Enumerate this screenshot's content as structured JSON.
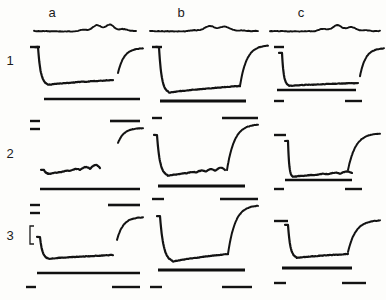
{
  "figure": {
    "kind": "multi-panel-recording-traces",
    "background_color": "#fdfdfb",
    "ink_color": "#131313",
    "width": 386,
    "height": 300,
    "columns": [
      {
        "id": "a",
        "label": "a",
        "label_x": 52,
        "label_y": 17,
        "origin_x": 22
      },
      {
        "id": "b",
        "label": "b",
        "label_x": 181,
        "label_y": 17,
        "origin_x": 150
      },
      {
        "id": "c",
        "label": "c",
        "label_x": 301,
        "label_y": 17,
        "origin_x": 270
      }
    ],
    "rows": [
      {
        "id": "1",
        "label": "1",
        "label_x": 10,
        "label_y": 65,
        "top": 35
      },
      {
        "id": "2",
        "label": "2",
        "label_x": 10,
        "label_y": 158,
        "top": 118
      },
      {
        "id": "3",
        "label": "3",
        "label_x": 10,
        "label_y": 240,
        "top": 202
      }
    ],
    "scale_bar": {
      "name": "vertical-scale-bracket",
      "label": "[",
      "x": 30,
      "y_top": 226,
      "y_bottom": 244,
      "arm": 4
    }
  },
  "chart_data": {
    "type": "line",
    "title": "",
    "xlabel": "",
    "ylabel": "",
    "grid": false,
    "legend": null,
    "panel_columns": [
      "a",
      "b",
      "c"
    ],
    "panel_rows": [
      "1",
      "2",
      "3"
    ],
    "header_traces": [
      {
        "panel": "a",
        "name": "header-noise-trace-a",
        "x_start": 34,
        "x_end": 136,
        "baseline_y": 31,
        "ripple_amplitude": 4.5,
        "ripple_count": 7,
        "bump_center_x": 104,
        "bump_height": 6
      },
      {
        "panel": "b",
        "name": "header-noise-trace-b",
        "x_start": 150,
        "x_end": 258,
        "baseline_y": 31,
        "ripple_amplitude": 3.5,
        "ripple_count": 6,
        "bump_center_x": 216,
        "bump_height": 5
      },
      {
        "panel": "c",
        "name": "header-noise-trace-c",
        "x_start": 270,
        "x_end": 380,
        "baseline_y": 31,
        "ripple_amplitude": 4,
        "ripple_count": 7,
        "bump_center_x": 340,
        "bump_height": 5
      }
    ],
    "panels": [
      {
        "row": "1",
        "col": "a",
        "name": "panel-1a",
        "baseline_tick": {
          "x1": 30,
          "x2": 40,
          "y": 47
        },
        "response": {
          "start_x": 38,
          "start_y": 47,
          "fall_end_x": 47,
          "trough_y": 85,
          "plateau_end_x": 113,
          "plateau_end_y": 80,
          "depth": 38,
          "oscillation": 0,
          "osc_count": 0
        },
        "recovery": {
          "x_start": 118,
          "x_end": 143,
          "y_bottom": 73,
          "y_top": 48
        },
        "stim_bar": {
          "x1": 44,
          "x2": 140,
          "y": 99,
          "width": 2.6
        }
      },
      {
        "row": "1",
        "col": "b",
        "name": "panel-1b",
        "baseline_tick": {
          "x1": 152,
          "x2": 162,
          "y": 47
        },
        "response": {
          "start_x": 159,
          "start_y": 47,
          "fall_end_x": 168,
          "trough_y": 93,
          "plateau_end_x": 240,
          "plateau_end_y": 86,
          "depth": 46,
          "oscillation": 0,
          "osc_count": 0
        },
        "recovery": {
          "x_start": 240,
          "x_end": 268,
          "y_bottom": 86,
          "y_top": 45
        },
        "stim_bar": {
          "x1": 160,
          "x2": 246,
          "y": 101,
          "width": 3.0
        }
      },
      {
        "row": "1",
        "col": "c",
        "name": "panel-1c",
        "baseline_tick": {
          "x1": 274,
          "x2": 284,
          "y": 47
        },
        "response": {
          "start_x": 282,
          "start_y": 53,
          "fall_end_x": 288,
          "trough_y": 86,
          "plateau_end_x": 358,
          "plateau_end_y": 83,
          "depth": 33,
          "oscillation": 0,
          "osc_count": 0
        },
        "recovery": {
          "x_start": 360,
          "x_end": 384,
          "y_bottom": 76,
          "y_top": 48
        },
        "stim_bar": {
          "x1": 277,
          "x2": 356,
          "y": 90,
          "width": 2.4
        },
        "extra_bar": {
          "x1": 274,
          "x2": 284,
          "y": 101
        },
        "extra_bar2": {
          "x1": 345,
          "x2": 362,
          "y": 101
        }
      },
      {
        "row": "2",
        "col": "a",
        "name": "panel-2a",
        "baseline_tick": {
          "x1": 30,
          "x2": 40,
          "y": 121
        },
        "baseline_tick2": {
          "x1": 30,
          "x2": 40,
          "y": 129
        },
        "response": {
          "start_x": 44,
          "start_y": 170,
          "fall_end_x": 50,
          "trough_y": 174,
          "plateau_end_x": 100,
          "plateau_end_y": 168,
          "depth": 6,
          "oscillation": 4,
          "osc_count": 5
        },
        "recovery": {
          "x_start": 118,
          "x_end": 143,
          "y_bottom": 143,
          "y_top": 128
        },
        "stim_bar": {
          "x1": 40,
          "x2": 140,
          "y": 189,
          "width": 2.4
        },
        "top_bar": {
          "x1": 110,
          "x2": 140,
          "y": 121
        }
      },
      {
        "row": "2",
        "col": "b",
        "name": "panel-2b",
        "baseline_tick": {
          "x1": 152,
          "x2": 162,
          "y": 118
        },
        "response": {
          "start_x": 157,
          "start_y": 135,
          "fall_end_x": 167,
          "trough_y": 176,
          "plateau_end_x": 225,
          "plateau_end_y": 170,
          "depth": 41,
          "oscillation": 3,
          "osc_count": 6
        },
        "recovery": {
          "x_start": 227,
          "x_end": 258,
          "y_bottom": 170,
          "y_top": 124
        },
        "stim_bar": {
          "x1": 158,
          "x2": 245,
          "y": 186,
          "width": 2.8
        },
        "top_bar": {
          "x1": 222,
          "x2": 258,
          "y": 118
        }
      },
      {
        "row": "2",
        "col": "c",
        "name": "panel-2c",
        "baseline_tick": {
          "x1": 274,
          "x2": 286,
          "y": 135
        },
        "response": {
          "start_x": 288,
          "start_y": 141,
          "fall_end_x": 292,
          "trough_y": 177,
          "plateau_end_x": 352,
          "plateau_end_y": 173,
          "depth": 36,
          "oscillation": 2,
          "osc_count": 5
        },
        "recovery": {
          "x_start": 348,
          "x_end": 380,
          "y_bottom": 170,
          "y_top": 133
        },
        "stim_bar": {
          "x1": 285,
          "x2": 352,
          "y": 180,
          "width": 2.4
        },
        "extra_bar": {
          "x1": 274,
          "x2": 284,
          "y": 189
        },
        "extra_bar2": {
          "x1": 345,
          "x2": 362,
          "y": 189
        }
      },
      {
        "row": "3",
        "col": "a",
        "name": "panel-3a",
        "baseline_tick": {
          "x1": 30,
          "x2": 40,
          "y": 205
        },
        "baseline_tick2": {
          "x1": 30,
          "x2": 40,
          "y": 213
        },
        "response": {
          "start_x": 40,
          "start_y": 237,
          "fall_end_x": 48,
          "trough_y": 259,
          "plateau_end_x": 113,
          "plateau_end_y": 255,
          "depth": 22,
          "oscillation": 0,
          "osc_count": 0
        },
        "recovery": {
          "x_start": 117,
          "x_end": 143,
          "y_bottom": 240,
          "y_top": 217
        },
        "stim_bar": {
          "x1": 37,
          "x2": 140,
          "y": 273,
          "width": 2.4
        },
        "top_bar": {
          "x1": 108,
          "x2": 140,
          "y": 205
        },
        "extra_bar": {
          "x1": 26,
          "x2": 36,
          "y": 287
        },
        "extra_bar2": {
          "x1": 112,
          "x2": 140,
          "y": 287
        }
      },
      {
        "row": "3",
        "col": "b",
        "name": "panel-3b",
        "baseline_tick": {
          "x1": 152,
          "x2": 164,
          "y": 199
        },
        "response": {
          "start_x": 160,
          "start_y": 216,
          "fall_end_x": 172,
          "trough_y": 262,
          "plateau_end_x": 228,
          "plateau_end_y": 254,
          "depth": 46,
          "oscillation": 0,
          "osc_count": 0
        },
        "recovery": {
          "x_start": 228,
          "x_end": 258,
          "y_bottom": 254,
          "y_top": 205
        },
        "stim_bar": {
          "x1": 158,
          "x2": 245,
          "y": 270,
          "width": 3.2
        },
        "top_bar": {
          "x1": 220,
          "x2": 258,
          "y": 199
        },
        "extra_bar": {
          "x1": 150,
          "x2": 162,
          "y": 287
        },
        "extra_bar2": {
          "x1": 222,
          "x2": 252,
          "y": 287
        }
      },
      {
        "row": "3",
        "col": "c",
        "name": "panel-3c",
        "baseline_tick": {
          "x1": 274,
          "x2": 288,
          "y": 221
        },
        "response": {
          "start_x": 288,
          "start_y": 225,
          "fall_end_x": 296,
          "trough_y": 258,
          "plateau_end_x": 348,
          "plateau_end_y": 254,
          "depth": 33,
          "oscillation": 0,
          "osc_count": 0
        },
        "recovery": {
          "x_start": 348,
          "x_end": 380,
          "y_bottom": 252,
          "y_top": 220
        },
        "stim_bar": {
          "x1": 282,
          "x2": 352,
          "y": 268,
          "width": 2.8
        },
        "extra_bar": {
          "x1": 274,
          "x2": 286,
          "y": 283
        },
        "extra_bar2": {
          "x1": 342,
          "x2": 366,
          "y": 283
        }
      }
    ]
  }
}
